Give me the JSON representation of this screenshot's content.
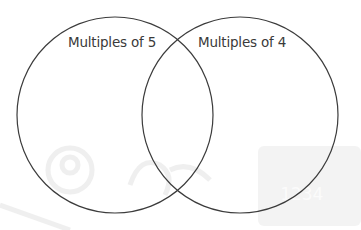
{
  "diagram": {
    "type": "venn",
    "sets": [
      {
        "label": "Multiples of 5",
        "cx": 115,
        "cy": 115,
        "r": 98
      },
      {
        "label": "Multiples of 4",
        "cx": 240,
        "cy": 115,
        "r": 98
      }
    ],
    "stroke_color": "#3c3c3c",
    "watermark_text": "1234"
  }
}
